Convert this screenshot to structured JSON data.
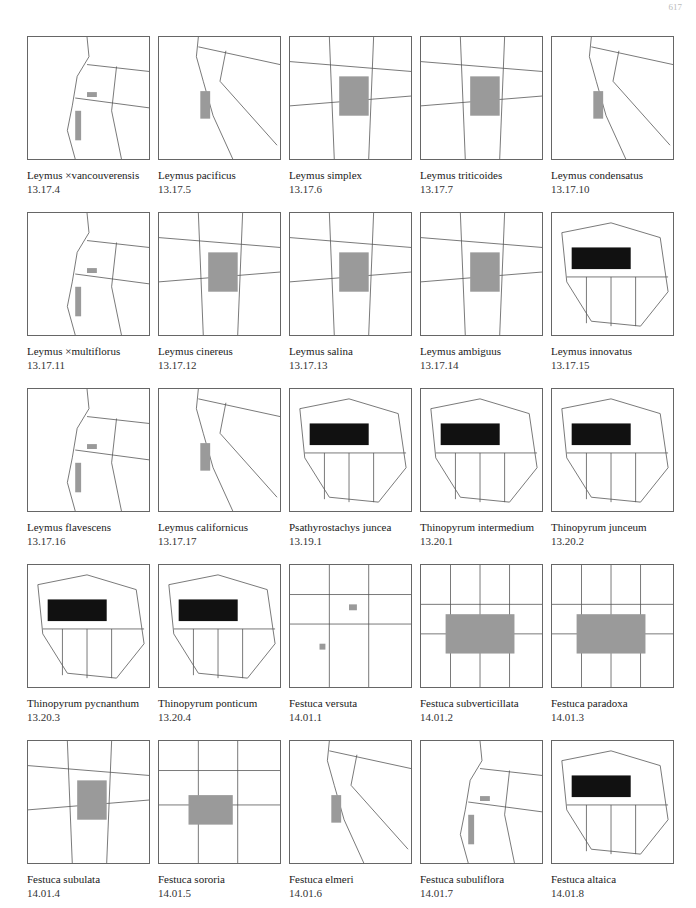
{
  "page": {
    "number": "617"
  },
  "maps": [
    {
      "species": "Leymus ×vancouverensis",
      "code": "13.17.4",
      "extent": "nw"
    },
    {
      "species": "Leymus pacificus",
      "code": "13.17.5",
      "extent": "ca"
    },
    {
      "species": "Leymus simplex",
      "code": "13.17.6",
      "extent": "west"
    },
    {
      "species": "Leymus triticoides",
      "code": "13.17.7",
      "extent": "west"
    },
    {
      "species": "Leymus condensatus",
      "code": "13.17.10",
      "extent": "ca"
    },
    {
      "species": "Leymus ×multiflorus",
      "code": "13.17.11",
      "extent": "nw"
    },
    {
      "species": "Leymus cinereus",
      "code": "13.17.12",
      "extent": "west"
    },
    {
      "species": "Leymus salina",
      "code": "13.17.13",
      "extent": "west"
    },
    {
      "species": "Leymus ambiguus",
      "code": "13.17.14",
      "extent": "west"
    },
    {
      "species": "Leymus innovatus",
      "code": "13.17.15",
      "extent": "na"
    },
    {
      "species": "Leymus flavescens",
      "code": "13.17.16",
      "extent": "nw"
    },
    {
      "species": "Leymus californicus",
      "code": "13.17.17",
      "extent": "ca"
    },
    {
      "species": "Psathyrostachys juncea",
      "code": "13.19.1",
      "extent": "na"
    },
    {
      "species": "Thinopyrum intermedium",
      "code": "13.20.1",
      "extent": "na"
    },
    {
      "species": "Thinopyrum junceum",
      "code": "13.20.2",
      "extent": "na"
    },
    {
      "species": "Thinopyrum pycnanthum",
      "code": "13.20.3",
      "extent": "na"
    },
    {
      "species": "Thinopyrum ponticum",
      "code": "13.20.4",
      "extent": "na"
    },
    {
      "species": "Festuca versuta",
      "code": "14.01.1",
      "extent": "south"
    },
    {
      "species": "Festuca subverticillata",
      "code": "14.01.2",
      "extent": "east"
    },
    {
      "species": "Festuca paradoxa",
      "code": "14.01.3",
      "extent": "east"
    },
    {
      "species": "Festuca subulata",
      "code": "14.01.4",
      "extent": "west"
    },
    {
      "species": "Festuca sororia",
      "code": "14.01.5",
      "extent": "sw"
    },
    {
      "species": "Festuca elmeri",
      "code": "14.01.6",
      "extent": "ca"
    },
    {
      "species": "Festuca subuliflora",
      "code": "14.01.7",
      "extent": "nw"
    },
    {
      "species": "Festuca altaica",
      "code": "14.01.8",
      "extent": "na"
    }
  ],
  "colors": {
    "range_gray": "#9a9a9a",
    "occurrence_black": "#111111",
    "border_line": "#555555"
  }
}
